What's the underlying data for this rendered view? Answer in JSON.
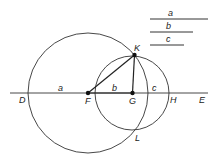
{
  "diagram": {
    "stroke_color": "#333333",
    "points": {
      "D": {
        "label": "D",
        "x": 29,
        "y": 93
      },
      "F": {
        "label": "F",
        "x": 88,
        "y": 93
      },
      "G": {
        "label": "G",
        "x": 132.5,
        "y": 93
      },
      "H": {
        "label": "H",
        "x": 169,
        "y": 93
      },
      "E": {
        "label": "E",
        "x": 205,
        "y": 93
      },
      "K": {
        "label": "K",
        "x": 134.5,
        "y": 55
      },
      "L": {
        "label": "L",
        "x": 134,
        "y": 130
      }
    },
    "segment_labels": {
      "a": "a",
      "b": "b",
      "c": "c"
    },
    "legend": [
      {
        "label": "a"
      },
      {
        "label": "b"
      },
      {
        "label": "c"
      }
    ],
    "circles": [
      {
        "name": "large-circle",
        "center": "F",
        "radius": 60
      },
      {
        "name": "small-circle",
        "center": "G",
        "radius": 37
      }
    ]
  }
}
